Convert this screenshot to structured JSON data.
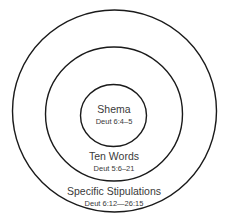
{
  "diagram": {
    "type": "concentric-circles",
    "rings": [
      {
        "id": "inner",
        "title": "Shema",
        "reference": "Deut 6:4–5"
      },
      {
        "id": "middle",
        "title": "Ten Words",
        "reference": "Deut 5:6–21"
      },
      {
        "id": "outer",
        "title": "Specific Stipulations",
        "reference": "Deut 6:12—26:15"
      }
    ],
    "colors": {
      "stroke": "#1a1a1a",
      "text": "#3a3a3a",
      "background": "#ffffff"
    }
  }
}
